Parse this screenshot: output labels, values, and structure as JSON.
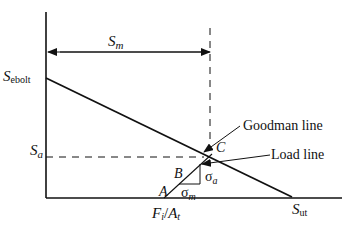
{
  "diagram": {
    "type": "goodman-diagram",
    "colors": {
      "line": "#111111",
      "background": "#ffffff"
    },
    "labels": {
      "sm": {
        "main": "S",
        "sub": "m"
      },
      "sebolt": {
        "main": "S",
        "sub": "ebolt"
      },
      "sa": {
        "main": "S",
        "sub": "a"
      },
      "sut": {
        "main": "S",
        "sub": "ut"
      },
      "fi_at": {
        "f": "F",
        "fi": "i",
        "slash": "/",
        "a": "A",
        "at": "t"
      },
      "point_a": "A",
      "point_b": "B",
      "point_c": "C",
      "sigma_a": {
        "main": "σ",
        "sub": "a"
      },
      "sigma_m": {
        "main": "σ",
        "sub": "m"
      },
      "goodman_line": "Goodman line",
      "load_line": "Load line"
    }
  }
}
